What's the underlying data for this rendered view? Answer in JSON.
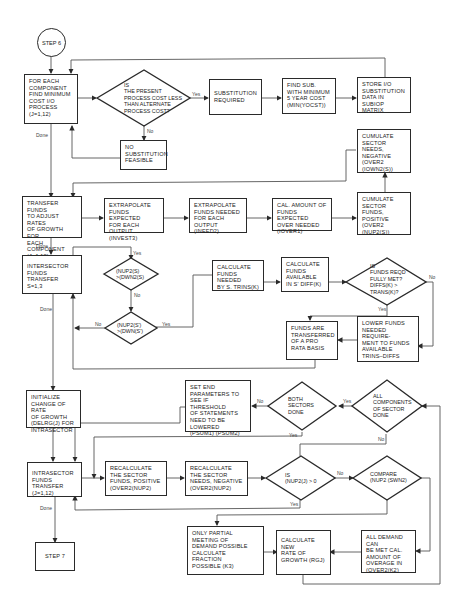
{
  "diagram": {
    "type": "flowchart",
    "start": "STEP 6",
    "end": "STEP 7",
    "nodes": {
      "step6": "STEP 6",
      "find_min_cost": "FOR EACH\nCOMPONENT\nFIND MINIMUM\nCOST I/O\nPROCESS\n(J=1,12)",
      "is_present_cost_less": "IS\nTHE PRESENT\nPROCESS COST LESS\nTHAN ALTERNATE\nPROCESS COST?",
      "substitution_required": "SUBSTITUTION\nREQUIRED",
      "find_sub_min": "FIND SUB.\nWITH MINIMUM\n5 YEAR COST\n(MIN(YOCST))",
      "store_io": "STORE I/O\nSUBSTITUTION\nDATA IN SUBIOP\nMATRIX",
      "no_substitution": "NO\nSUBSTITUTION\nFEASIBLE",
      "cumulate_needs_neg": "CUMULATE\nSECTOR NEEDS,\nNEGATIVE\n(OVER2\n(IOWN2(S))",
      "transfer_funds": "TRANSFER FUNDS\nTO ADJUST RATES\nOF GROWTH FOR\nEACH COMPONENT\n(J=1,12)",
      "extrap_expected": "EXTRAPOLATE\nFUNDS EXPECTED\nFOR EACH OUTPUT\n(INVEST3)",
      "extrap_needed": "EXTRAPOLATE\nFUNDS NEEDED\nFOR EACH OUTPUT\n(INEED2)",
      "cal_amount": "CAL. AMOUNT OF\nFUNDS EXPECTED\nOVER NEEDED\n(IOVER1)",
      "cumulate_funds_pos": "CUMULATE\nSECTOR FUNDS,\nPOSITIVE\n(OVER2\n(NUP2(S))",
      "intersector": "INTERSECTOR\nFUNDS TRANSFER\nS=1,3",
      "nup2_gt_dwn2": "(NUP2(S)\n>(DWN2(S)",
      "nup2s_gt_dwns": "(NUP2(S')\n>(DWN(S')",
      "calc_needed": "CALCULATE\nFUNDS NEEDED\nBY S. TRINS(K)",
      "calc_available": "CALCULATE\nFUNDS\nAVAILABLE\nIN S' DIFF(K)",
      "is_funds_met": "IS\nFUNDS REQD\nFULLY MET?\nDIFFS(K) >\nTRANS(K)?",
      "pro_rata": "FUNDS ARE\nTRANSFERRED\nOF A PRO\nRATA BASIS",
      "lower_funds": "LOWER FUNDS\nNEEDED REQUIRE-\nMENT TO FUNDS\nAVAILABLE\nTRINS–DIFFS",
      "initialize": "INITIALIZE\nCHANGE OF RATE\nOF GROWTH\n(DELRG(J) FOR\nINTRASECTOR",
      "set_end_params": "SET END\nPARAMETERS TO\nSEE IF THRESHOLD\nOF STATEMENTS\nNEED TO BE\nLOWERED\n(PSUM1) (PSUM2)",
      "both_sectors": "BOTH\nSECTORS\nDONE",
      "all_components": "ALL\nCOMPONENTS\nOF SECTOR\nDONE",
      "intrasector": "INTRASECTOR\nFUNDS TRANSFER\n(J=1,12)",
      "recalc_pos": "RECALCULATE\nTHE SECTOR\nFUNDS, POSITIVE\n(OVER2(NUP2)",
      "recalc_neg": "RECALCULATE\nTHE SECTOR\nNEEDS, NEGATIVE\n(OVER2(NUP2)",
      "is_nup2": "IS\n(NUP2(J) > 0",
      "compare": "COMPARE\n(NUP2 (SWN2)",
      "step7": "STEP 7",
      "only_partial": "ONLY PARTIAL\nMEETING OF\nDEMAND POSSIBLE\nCALCULATE\nFRACTION\nPOSSIBLE (K3)",
      "calc_new_rate": "CALCULATE\nNEW\nRATE OF\nGROWTH (RGJ)",
      "all_demand": "ALL DEMAND CAN\nBE MET CAL.\nAMOUNT OF\nOVERAGE IN\n(OVER2(K2)"
    },
    "edge_labels": {
      "yes": "Yes",
      "no": "No",
      "done": "Done"
    }
  }
}
